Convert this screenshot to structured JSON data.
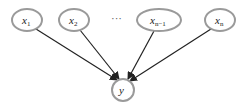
{
  "diagram": {
    "type": "graphical-model",
    "nodes": [
      {
        "id": "x1",
        "label": "x",
        "subscript": "1"
      },
      {
        "id": "x2",
        "label": "x",
        "subscript": "2"
      },
      {
        "id": "xn-1",
        "label": "x",
        "subscript": "n−1"
      },
      {
        "id": "xn",
        "label": "x",
        "subscript": "n"
      },
      {
        "id": "y",
        "label": "y",
        "subscript": ""
      }
    ],
    "ellipsis": "···",
    "edges": [
      {
        "from": "x1",
        "to": "y"
      },
      {
        "from": "x2",
        "to": "y"
      },
      {
        "from": "xn-1",
        "to": "y"
      },
      {
        "from": "xn",
        "to": "y"
      }
    ],
    "colors": {
      "node_stroke": "#9a9a9a",
      "edge": "#222222",
      "background": "#ffffff"
    }
  }
}
